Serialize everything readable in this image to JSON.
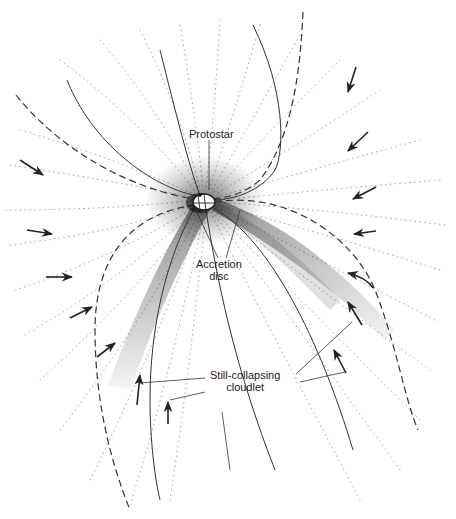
{
  "figure": {
    "type": "scientific-illustration",
    "colors": {
      "line": "#333333",
      "stipple": "#000000",
      "flow_dots": "#999999",
      "background": "#ffffff"
    }
  },
  "labels": {
    "protostar": "Protostar",
    "accretion_disc_line1": "Accretion",
    "accretion_disc_line2": "disc",
    "cloudlet_line1": "Still-collapsing",
    "cloudlet_line2": "cloudlet"
  },
  "elements": {
    "infall_arrows": 14,
    "cloudlet_arrows": 4,
    "dashed_boundaries": [
      "upper-right boundary",
      "upper-left boundary",
      "lower-left boundary",
      "lower-right boundary"
    ],
    "solid_field_lines": 5
  }
}
